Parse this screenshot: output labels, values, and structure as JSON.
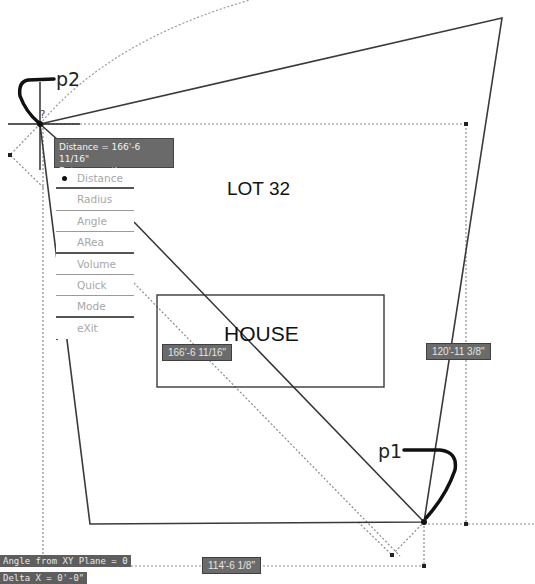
{
  "drawing": {
    "lot_label": "LOT 32",
    "house_label": "HOUSE",
    "point_labels": {
      "p1": "p1",
      "p2": "p2"
    },
    "colors": {
      "line": "#333333",
      "dotted": "#8a8a8a",
      "dim_box": "#6b6b6b",
      "background": "#ffffff"
    }
  },
  "tooltip": {
    "line1": "Distance = 166'-6 11/16\"",
    "line2": "Enter an option"
  },
  "menu": {
    "selected": "Distance",
    "items": [
      {
        "label": "Distance"
      },
      {
        "label": "Radius"
      },
      {
        "label": "Angle"
      },
      {
        "label": "ARea"
      },
      {
        "label": "Volume"
      },
      {
        "label": "Quick"
      },
      {
        "label": "Mode"
      },
      {
        "label": "eXit"
      }
    ]
  },
  "dimensions": {
    "diagonal": "166'-6 11/16\"",
    "vertical": "120'-11 3/8\"",
    "horizontal": "114'-6 1/8\""
  },
  "command_line": {
    "line1": "Angle from XY Plane = 0",
    "line2": "Delta X = 0'-0\""
  }
}
